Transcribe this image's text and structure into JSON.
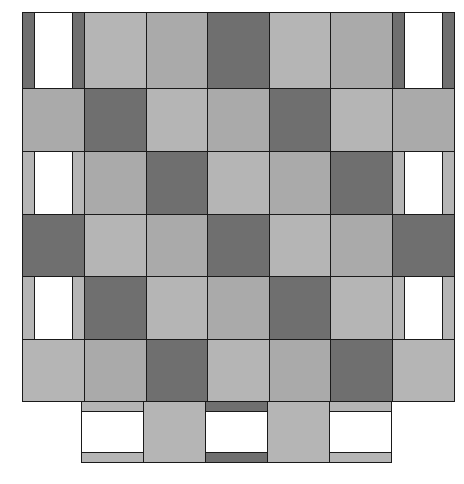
{
  "figure": {
    "colors": {
      "dark": "#6f6f6f",
      "light": "#b5b5b5",
      "light2": "#aaaaaa",
      "white": "#ffffff",
      "border": "#1a1a1a"
    },
    "grid": {
      "columns": 7,
      "rows": 6,
      "col_edges": [
        22,
        84,
        146,
        207,
        269,
        330,
        392,
        454
      ],
      "row_edges": [
        12,
        88,
        151,
        214,
        276,
        339,
        401
      ]
    },
    "rows": [
      [
        "W-dark",
        "L",
        "L2",
        "D",
        "L",
        "L2",
        "W-dark"
      ],
      [
        "L2",
        "D",
        "L",
        "L2",
        "D",
        "L",
        "L2"
      ],
      [
        "W-light",
        "L2",
        "D",
        "L",
        "L2",
        "D",
        "W-light"
      ],
      [
        "D",
        "L",
        "L2",
        "D",
        "L",
        "L2",
        "D"
      ],
      [
        "W-light",
        "D",
        "L",
        "L2",
        "D",
        "L",
        "W-light"
      ],
      [
        "L",
        "L2",
        "D",
        "L",
        "L2",
        "D",
        "L"
      ]
    ],
    "bottom_row": {
      "y_top": 401,
      "y_bottom": 463,
      "x_start": 81,
      "x_end": 391,
      "tiles": [
        "H-light",
        "L",
        "H-dark",
        "L",
        "H-light"
      ]
    }
  }
}
